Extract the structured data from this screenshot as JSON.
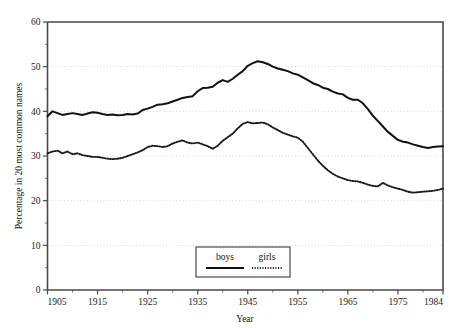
{
  "chart_data": {
    "type": "line",
    "title": "",
    "xlabel": "Year",
    "ylabel": "Percentage in 20 most common names",
    "xlim": [
      1905,
      1984
    ],
    "ylim": [
      0,
      60
    ],
    "grid": true,
    "legend_position": "bottom-center",
    "x_ticks": [
      1905,
      1915,
      1925,
      1935,
      1945,
      1955,
      1965,
      1975,
      1984
    ],
    "x_tick_labels": [
      "1905",
      "1915",
      "1925",
      "1935",
      "1945",
      "1955",
      "1965",
      "1975",
      "1984"
    ],
    "x_minor_ticks": [
      1910,
      1920,
      1930,
      1940,
      1950,
      1960,
      1970,
      1980
    ],
    "y_ticks": [
      0,
      10,
      20,
      30,
      40,
      50,
      60
    ],
    "y_tick_labels": [
      "0",
      "10",
      "20",
      "30",
      "40",
      "50",
      "60"
    ],
    "y_minor_ticks": [
      5,
      15,
      25,
      35,
      45,
      55
    ],
    "x": [
      1905,
      1906,
      1907,
      1908,
      1909,
      1910,
      1911,
      1912,
      1913,
      1914,
      1915,
      1916,
      1917,
      1918,
      1919,
      1920,
      1921,
      1922,
      1923,
      1924,
      1925,
      1926,
      1927,
      1928,
      1929,
      1930,
      1931,
      1932,
      1933,
      1934,
      1935,
      1936,
      1937,
      1938,
      1939,
      1940,
      1941,
      1942,
      1943,
      1944,
      1945,
      1946,
      1947,
      1948,
      1949,
      1950,
      1951,
      1952,
      1953,
      1954,
      1955,
      1956,
      1957,
      1958,
      1959,
      1960,
      1961,
      1962,
      1963,
      1964,
      1965,
      1966,
      1967,
      1968,
      1969,
      1970,
      1971,
      1972,
      1973,
      1974,
      1975,
      1976,
      1977,
      1978,
      1979,
      1980,
      1981,
      1982,
      1983,
      1984
    ],
    "series": [
      {
        "name": "boys",
        "style": "solid",
        "color": "#111111",
        "values": [
          38.9,
          40.0,
          39.6,
          39.2,
          39.4,
          39.6,
          39.4,
          39.2,
          39.5,
          39.8,
          39.7,
          39.4,
          39.2,
          39.3,
          39.1,
          39.2,
          39.4,
          39.3,
          39.5,
          40.3,
          40.6,
          41.0,
          41.5,
          41.6,
          41.8,
          42.2,
          42.6,
          43.0,
          43.2,
          43.4,
          44.5,
          45.2,
          45.3,
          45.5,
          46.4,
          47.0,
          46.6,
          47.3,
          48.2,
          49.0,
          50.2,
          50.8,
          51.2,
          51.0,
          50.6,
          50.0,
          49.6,
          49.3,
          49.0,
          48.5,
          48.2,
          47.6,
          47.0,
          46.3,
          45.9,
          45.3,
          45.0,
          44.4,
          44.0,
          43.8,
          43.0,
          42.6,
          42.6,
          41.8,
          40.5,
          39.0,
          37.8,
          36.6,
          35.4,
          34.5,
          33.6,
          33.2,
          33.0,
          32.6,
          32.3,
          32.0,
          31.8,
          32.0,
          32.1,
          32.2
        ]
      },
      {
        "name": "girls",
        "style": "dotted",
        "color": "#1a1a1a",
        "values": [
          30.6,
          31.0,
          31.2,
          30.6,
          31.0,
          30.4,
          30.6,
          30.2,
          30.0,
          29.8,
          29.8,
          29.6,
          29.4,
          29.3,
          29.4,
          29.6,
          30.0,
          30.4,
          30.8,
          31.3,
          32.0,
          32.3,
          32.2,
          32.0,
          32.2,
          32.8,
          33.2,
          33.5,
          33.0,
          32.8,
          33.0,
          32.6,
          32.2,
          31.6,
          32.3,
          33.4,
          34.2,
          35.0,
          36.2,
          37.2,
          37.6,
          37.3,
          37.4,
          37.5,
          37.1,
          36.4,
          35.8,
          35.2,
          34.8,
          34.4,
          34.1,
          33.2,
          31.8,
          30.4,
          29.0,
          27.8,
          26.8,
          26.0,
          25.4,
          25.0,
          24.6,
          24.4,
          24.3,
          24.0,
          23.6,
          23.3,
          23.2,
          24.0,
          23.4,
          23.0,
          22.7,
          22.4,
          22.0,
          21.8,
          21.9,
          22.0,
          22.1,
          22.2,
          22.4,
          22.7
        ]
      }
    ]
  },
  "legend": {
    "entries": [
      {
        "label": "boys"
      },
      {
        "label": "girls"
      }
    ]
  }
}
